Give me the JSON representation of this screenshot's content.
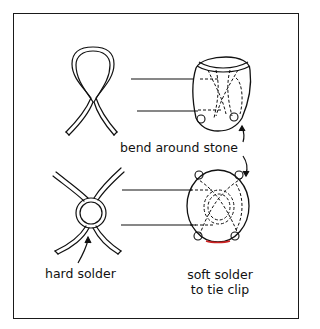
{
  "diagram": {
    "labels": {
      "bend": "bend around stone",
      "hard_solder": "hard solder",
      "soft_solder_line1": "soft solder",
      "soft_solder_line2": "to tie clip"
    },
    "colors": {
      "ink": "#111111",
      "background": "#ffffff",
      "solder_accent": "#cc2222"
    },
    "steps": [
      {
        "name": "loop-wire",
        "description": "Single wire bent into a loop with crossed ends"
      },
      {
        "name": "looped-wire-on-stone",
        "description": "Loop wire bent around tapered stone"
      },
      {
        "name": "double-loop-wire",
        "description": "Two wires crossed with center ring, hard soldered"
      },
      {
        "name": "double-wire-on-oval-stone",
        "description": "Wire bent around oval stone, soft soldered to tie clip"
      }
    ]
  }
}
